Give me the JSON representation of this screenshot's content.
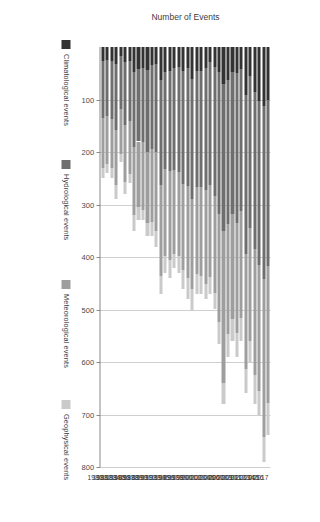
{
  "chart_data": {
    "type": "bar",
    "orientation": "horizontal-stacked",
    "title": "",
    "xlabel": "Number of Events",
    "ylabel": "",
    "xlim": [
      0,
      800
    ],
    "xticks": [
      800,
      700,
      600,
      500,
      400,
      300,
      200,
      100
    ],
    "grid": true,
    "legend_position": "right",
    "categories": [
      "2017",
      "2016",
      "2015",
      "2014",
      "2013",
      "2012",
      "2011",
      "2010",
      "2009",
      "2008",
      "2007",
      "2006",
      "2005",
      "2004",
      "2003",
      "2002",
      "2001",
      "2000",
      "1999",
      "1998",
      "1997",
      "1996",
      "1995",
      "1994",
      "1993",
      "1992",
      "1991",
      "1990",
      "1989",
      "1988",
      "1987",
      "1986",
      "1985",
      "1984",
      "1983",
      "1982",
      "1981",
      "1980"
    ],
    "series": [
      {
        "name": "Climatological events",
        "color": "#333333",
        "values": [
          100,
          112,
          103,
          85,
          55,
          92,
          42,
          50,
          48,
          62,
          70,
          48,
          38,
          28,
          40,
          46,
          45,
          60,
          40,
          45,
          38,
          40,
          46,
          48,
          62,
          32,
          34,
          44,
          40,
          42,
          48,
          26,
          28,
          18,
          32,
          26,
          24,
          26
        ]
      },
      {
        "name": "Hydrological events",
        "color": "#6e6e6e",
        "values": [
          318,
          330,
          312,
          300,
          290,
          302,
          270,
          285,
          270,
          275,
          280,
          270,
          245,
          235,
          232,
          220,
          222,
          230,
          225,
          215,
          200,
          195,
          190,
          185,
          200,
          168,
          160,
          156,
          140,
          138,
          142,
          115,
          120,
          100,
          126,
          112,
          108,
          110
        ]
      },
      {
        "name": "Meteorological events",
        "color": "#9e9e9e",
        "values": [
          260,
          300,
          240,
          240,
          215,
          220,
          205,
          210,
          200,
          210,
          290,
          205,
          185,
          175,
          180,
          170,
          165,
          170,
          175,
          165,
          160,
          160,
          170,
          165,
          175,
          150,
          140,
          135,
          130,
          125,
          130,
          100,
          110,
          85,
          105,
          92,
          90,
          95
        ]
      },
      {
        "name": "Geophysical events",
        "color": "#cacaca",
        "values": [
          62,
          48,
          45,
          55,
          40,
          46,
          43,
          45,
          42,
          43,
          40,
          42,
          32,
          32,
          28,
          34,
          38,
          40,
          40,
          35,
          32,
          25,
          34,
          32,
          33,
          30,
          26,
          25,
          20,
          25,
          30,
          19,
          22,
          17,
          27,
          20,
          18,
          19
        ]
      }
    ],
    "totals": [
      740,
      790,
      700,
      680,
      600,
      660,
      560,
      590,
      560,
      590,
      680,
      565,
      500,
      470,
      480,
      470,
      470,
      500,
      480,
      460,
      430,
      420,
      440,
      430,
      470,
      380,
      360,
      360,
      330,
      330,
      350,
      260,
      280,
      220,
      290,
      250,
      240,
      250
    ]
  },
  "legend": {
    "items": [
      {
        "label": "Climatological events",
        "color": "#333333"
      },
      {
        "label": "Hydrological events",
        "color": "#6e6e6e"
      },
      {
        "label": "Meteorological events",
        "color": "#9e9e9e"
      },
      {
        "label": "Geophysical events",
        "color": "#cacaca"
      }
    ]
  }
}
